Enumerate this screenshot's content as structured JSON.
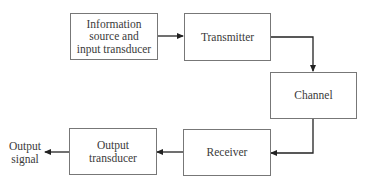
{
  "diagram": {
    "type": "block-diagram",
    "title": "",
    "nodes": [
      {
        "id": "source",
        "label": "Information source and input transducer",
        "lines": [
          "Information",
          "source and",
          "input transducer"
        ]
      },
      {
        "id": "transmitter",
        "label": "Transmitter"
      },
      {
        "id": "channel",
        "label": "Channel"
      },
      {
        "id": "receiver",
        "label": "Receiver"
      },
      {
        "id": "output_transducer",
        "label": "Output transducer",
        "lines": [
          "Output",
          "transducer"
        ]
      }
    ],
    "output": {
      "lines": [
        "Output",
        "signal"
      ]
    },
    "edges": [
      {
        "from": "source",
        "to": "transmitter"
      },
      {
        "from": "transmitter",
        "to": "channel"
      },
      {
        "from": "channel",
        "to": "receiver"
      },
      {
        "from": "receiver",
        "to": "output_transducer"
      },
      {
        "from": "output_transducer",
        "to": "output_signal"
      }
    ],
    "colors": {
      "stroke": "#777777",
      "arrow": "#222222",
      "text": "#3a3a3a"
    }
  }
}
